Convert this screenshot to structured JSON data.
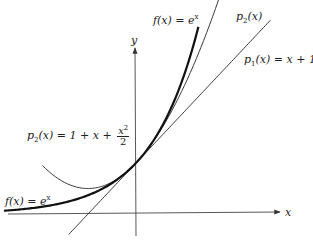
{
  "chart_data": {
    "type": "line",
    "title": "",
    "xlabel": "x",
    "ylabel": "y",
    "grid": false,
    "xlim": [
      -2.75,
      4.0
    ],
    "ylim": [
      -0.8,
      3.7
    ],
    "series": [
      {
        "name": "f(x) = e^x",
        "expr": "exp",
        "x_range": [
          -2.75,
          1.3
        ],
        "stroke_width": 2.2
      },
      {
        "name": "p1(x) = x + 1",
        "expr": "p1",
        "x_range": [
          -1.4,
          2.8
        ],
        "stroke_width": 0.9
      },
      {
        "name": "p2(x) = 1 + x + x^2/2",
        "expr": "p2",
        "x_range": [
          -1.95,
          1.75
        ],
        "stroke_width": 0.9
      }
    ],
    "annotations": [
      {
        "text": "f(x) = e^x",
        "near": "top of e^x curve"
      },
      {
        "text": "p2(x)",
        "near": "top of p2 curve"
      },
      {
        "text": "p1(x) = x + 1",
        "near": "top of p1 line"
      },
      {
        "text": "p2(x) = 1 + x + x^2/2",
        "near": "left branch of p2"
      },
      {
        "text": "f(x) = e^x",
        "near": "left tail of e^x"
      }
    ]
  },
  "layout": {
    "origin_px": [
      136,
      214
    ],
    "unit_x_px": 48,
    "unit_y_px": 51,
    "stroke_color": "#222222"
  },
  "labels": {
    "axis_x": "x",
    "axis_y": "y",
    "f_top": {
      "base": "f(x) = e",
      "sup": "x"
    },
    "p2_top": {
      "p": "p",
      "sub": "2",
      "rest": "(x)"
    },
    "p1_top": {
      "p": "p",
      "sub": "1",
      "rest": "(x) = x + 1"
    },
    "p2_left": {
      "p": "p",
      "sub": "2",
      "rest": "(x) = 1 + x + ",
      "num_base": "x",
      "num_sup": "2",
      "den": "2"
    },
    "f_left": {
      "base": "f(x) = e",
      "sup": "x"
    }
  }
}
